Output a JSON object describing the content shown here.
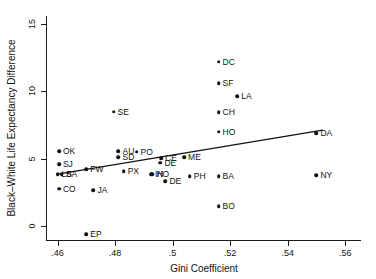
{
  "chart_data": {
    "type": "scatter",
    "title": "",
    "xlabel": "Gini Coefficient",
    "ylabel": "Black–White Life Expectancy Difference",
    "xlim": [
      0.456,
      0.5655
    ],
    "ylim": [
      -1.05,
      15.6
    ],
    "xticks": [
      0.46,
      0.48,
      0.5,
      0.52,
      0.54,
      0.56
    ],
    "xticklabels": [
      ".46",
      ".48",
      ".5",
      ".52",
      ".54",
      ".56"
    ],
    "yticks": [
      0,
      5,
      10,
      15
    ],
    "yticklabels": [
      "0",
      "5",
      "10",
      "15"
    ],
    "grid": false,
    "legend": null,
    "points": [
      {
        "label": "OK",
        "x": 0.4605,
        "y": 5.55,
        "label_side": "right"
      },
      {
        "label": "SJ",
        "x": 0.4605,
        "y": 4.6,
        "label_side": "right"
      },
      {
        "label": "LB",
        "x": 0.46,
        "y": 3.85,
        "label_side": "right"
      },
      {
        "label": "SA",
        "x": 0.4615,
        "y": 3.85,
        "label_side": "right"
      },
      {
        "label": "CO",
        "x": 0.4605,
        "y": 2.75,
        "label_side": "right"
      },
      {
        "label": "FW",
        "x": 0.47,
        "y": 4.2,
        "label_side": "right"
      },
      {
        "label": "JA",
        "x": 0.4725,
        "y": 2.65,
        "label_side": "right"
      },
      {
        "label": "EP",
        "x": 0.47,
        "y": -0.6,
        "label_side": "right"
      },
      {
        "label": "SE",
        "x": 0.4795,
        "y": 8.5,
        "label_side": "right"
      },
      {
        "label": "AU",
        "x": 0.4812,
        "y": 5.55,
        "label_side": "right"
      },
      {
        "label": "SD",
        "x": 0.4812,
        "y": 5.1,
        "label_side": "right"
      },
      {
        "label": "PO",
        "x": 0.4875,
        "y": 5.5,
        "label_side": "right"
      },
      {
        "label": "PX",
        "x": 0.483,
        "y": 4.05,
        "label_side": "right"
      },
      {
        "label": "CE",
        "x": 0.496,
        "y": 5.05,
        "label_side": "right"
      },
      {
        "label": "DE",
        "x": 0.4958,
        "y": 4.7,
        "label_side": "right"
      },
      {
        "label": "IN",
        "x": 0.4925,
        "y": 3.85,
        "label_side": "right"
      },
      {
        "label": "HO",
        "x": 0.493,
        "y": 3.85,
        "label_side": "right"
      },
      {
        "label": "DE",
        "x": 0.4975,
        "y": 3.3,
        "label_side": "right"
      },
      {
        "label": "ME",
        "x": 0.504,
        "y": 5.1,
        "label_side": "right"
      },
      {
        "label": "PH",
        "x": 0.506,
        "y": 3.7,
        "label_side": "right"
      },
      {
        "label": "DC",
        "x": 0.516,
        "y": 12.2,
        "label_side": "right"
      },
      {
        "label": "SF",
        "x": 0.516,
        "y": 10.6,
        "label_side": "right"
      },
      {
        "label": "CH",
        "x": 0.516,
        "y": 8.45,
        "label_side": "right"
      },
      {
        "label": "HO",
        "x": 0.516,
        "y": 7.0,
        "label_side": "right"
      },
      {
        "label": "LA",
        "x": 0.5225,
        "y": 9.65,
        "label_side": "right"
      },
      {
        "label": "BA",
        "x": 0.516,
        "y": 3.7,
        "label_side": "right"
      },
      {
        "label": "BO",
        "x": 0.516,
        "y": 1.45,
        "label_side": "right"
      },
      {
        "label": "DA",
        "x": 0.55,
        "y": 6.9,
        "label_side": "right"
      },
      {
        "label": "NY",
        "x": 0.55,
        "y": 3.75,
        "label_side": "right"
      }
    ],
    "fit_line": {
      "name": "linear-fit",
      "x_start": 0.4595,
      "y_start": 3.83,
      "x_end": 0.5522,
      "y_end": 7.12
    }
  }
}
